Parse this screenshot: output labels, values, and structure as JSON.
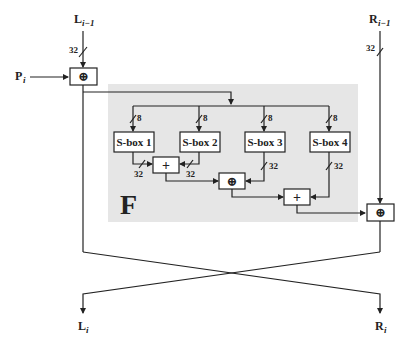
{
  "diagram": {
    "inputs": {
      "left": {
        "label": "L",
        "subscript": "i−1",
        "width_label": "32"
      },
      "right": {
        "label": "R",
        "subscript": "i−1",
        "width_label": "32"
      },
      "subkey": {
        "label": "P",
        "subscript": "i"
      }
    },
    "outputs": {
      "left": {
        "label": "L",
        "subscript": "i"
      },
      "right": {
        "label": "R",
        "subscript": "i"
      }
    },
    "f_function": {
      "label": "F",
      "background_color": "#e6e6e6",
      "sboxes": [
        {
          "label": "S-box 1",
          "in_width": "8",
          "out_width": "32"
        },
        {
          "label": "S-box 2",
          "in_width": "8",
          "out_width": "32"
        },
        {
          "label": "S-box 3",
          "in_width": "8",
          "out_width": "32"
        },
        {
          "label": "S-box 4",
          "in_width": "8",
          "out_width": "32"
        }
      ],
      "operators": {
        "add1": "+",
        "xor1": "⊕",
        "add2": "+"
      }
    },
    "operators": {
      "xor_left": "⊕",
      "xor_right": "⊕"
    }
  }
}
